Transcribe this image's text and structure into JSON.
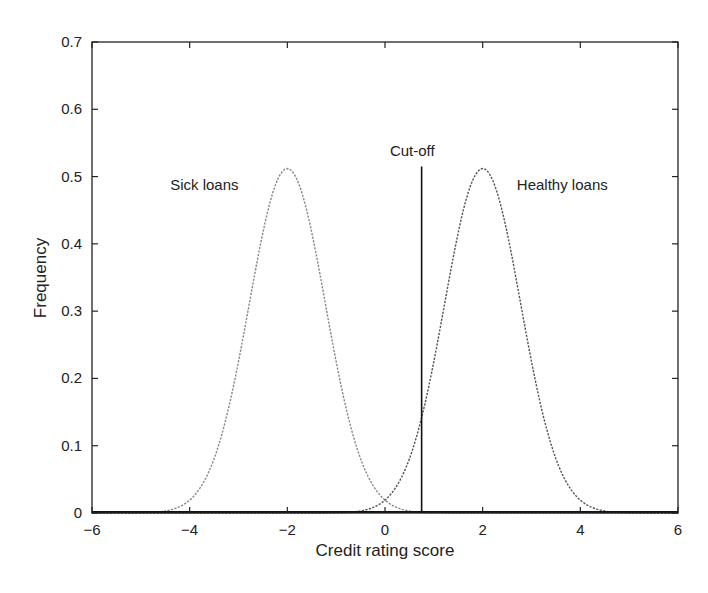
{
  "chart_data": {
    "type": "line",
    "title": "",
    "xlabel": "Credit rating score",
    "ylabel": "Frequency",
    "xlim": [
      -6,
      6
    ],
    "ylim": [
      0,
      0.7
    ],
    "xticks": [
      -6,
      -4,
      -2,
      0,
      2,
      4,
      6
    ],
    "xtick_labels": [
      "−6",
      "−4",
      "−2",
      "0",
      "2",
      "4",
      "6"
    ],
    "yticks": [
      0,
      0.1,
      0.2,
      0.3,
      0.4,
      0.5,
      0.6,
      0.7
    ],
    "ytick_labels": [
      "0",
      "0.1",
      "0.2",
      "0.3",
      "0.4",
      "0.5",
      "0.6",
      "0.7"
    ],
    "grid": false,
    "legend": "none (inline annotations)",
    "series": [
      {
        "name": "Sick loans",
        "distribution": "normal",
        "mean": -2,
        "std": 0.78,
        "peak": 0.512,
        "style": "dotted gray",
        "color": "#888888",
        "x": [
          -6,
          -5,
          -4,
          -3.5,
          -3,
          -2.5,
          -2,
          -1.5,
          -1,
          -0.5,
          0,
          0.5,
          1,
          1.5,
          2
        ],
        "values": [
          0.0,
          0.0025,
          0.021,
          0.081,
          0.225,
          0.416,
          0.512,
          0.416,
          0.225,
          0.081,
          0.021,
          0.0025,
          0.0003,
          0.0,
          0.0
        ]
      },
      {
        "name": "Healthy loans",
        "distribution": "normal",
        "mean": 2,
        "std": 0.78,
        "peak": 0.512,
        "style": "dotted dark",
        "color": "#555555",
        "x": [
          -2,
          -1.5,
          -1,
          -0.5,
          0,
          0.5,
          1,
          1.5,
          2,
          2.5,
          3,
          3.5,
          4,
          5,
          6
        ],
        "values": [
          0.0,
          0.0,
          0.0003,
          0.0025,
          0.021,
          0.081,
          0.225,
          0.416,
          0.512,
          0.416,
          0.225,
          0.081,
          0.021,
          0.0025,
          0.0
        ]
      }
    ],
    "annotations": [
      {
        "text": "Sick loans",
        "x": -4.4,
        "y": 0.48
      },
      {
        "text": "Healthy loans",
        "x": 2.7,
        "y": 0.48
      },
      {
        "text": "Cut-off",
        "x": 0.1,
        "y": 0.53
      }
    ],
    "vertical_lines": [
      {
        "name": "Cut-off",
        "x": 0.75,
        "y_from": 0,
        "y_to": 0.515,
        "color": "#111111"
      }
    ]
  },
  "labels": {
    "xlabel": "Credit rating score",
    "ylabel": "Frequency",
    "sick": "Sick loans",
    "healthy": "Healthy loans",
    "cutoff": "Cut-off"
  }
}
